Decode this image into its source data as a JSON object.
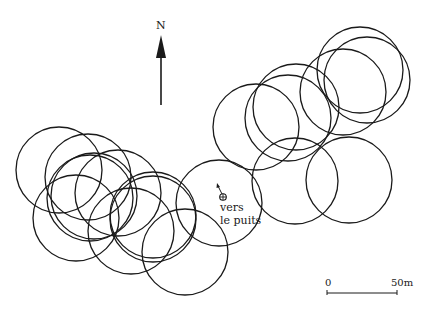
{
  "map": {
    "north_label": "N",
    "well_label_line1": "vers",
    "well_label_line2": "le puits",
    "scale": {
      "start_label": "0",
      "end_label": "50m",
      "x1": 327,
      "x2": 397,
      "y": 293
    },
    "stroke_color": "#1a1a1a",
    "circle_radius": 43,
    "circles": [
      {
        "cx": 59,
        "cy": 170
      },
      {
        "cx": 88,
        "cy": 177
      },
      {
        "cx": 90,
        "cy": 198
      },
      {
        "cx": 94,
        "cy": 196
      },
      {
        "cx": 118,
        "cy": 193
      },
      {
        "cx": 76,
        "cy": 218
      },
      {
        "cx": 153,
        "cy": 215
      },
      {
        "cx": 153,
        "cy": 219
      },
      {
        "cx": 131,
        "cy": 231
      },
      {
        "cx": 185,
        "cy": 252
      },
      {
        "cx": 219,
        "cy": 203
      },
      {
        "cx": 256,
        "cy": 127
      },
      {
        "cx": 288,
        "cy": 118
      },
      {
        "cx": 296,
        "cy": 107
      },
      {
        "cx": 343,
        "cy": 92
      },
      {
        "cx": 360,
        "cy": 70
      },
      {
        "cx": 367,
        "cy": 80
      },
      {
        "cx": 295,
        "cy": 181
      },
      {
        "cx": 349,
        "cy": 180
      }
    ],
    "well_icon": "well-cross-circle-icon",
    "north_icon": "north-arrow-icon"
  }
}
